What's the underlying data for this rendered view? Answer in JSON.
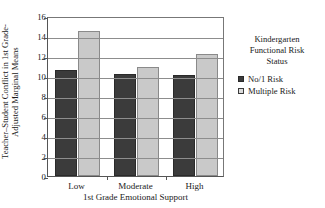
{
  "chart_data": {
    "type": "bar",
    "title": "",
    "xlabel": "1st Grade Emotional Support",
    "ylabel_line1": "Teacher–Student Conflict in 1st Grade-",
    "ylabel_line2": "Adjusted Marginal Means",
    "categories": [
      "Low",
      "Moderate",
      "High"
    ],
    "series": [
      {
        "name": "No/1 Risk",
        "values": [
          10.6,
          10.2,
          10.1
        ],
        "color": "#3b3b3b"
      },
      {
        "name": "Multiple Risk",
        "values": [
          14.5,
          10.9,
          12.2
        ],
        "color": "#c9c9c9"
      }
    ],
    "ylim": [
      0,
      16
    ],
    "yticks": [
      0,
      2,
      4,
      6,
      8,
      10,
      12,
      14,
      16
    ],
    "ytick_labels": [
      "0",
      "2",
      "4",
      "6",
      "8",
      "10",
      "12",
      "14",
      "16"
    ],
    "grid": true,
    "legend_position": "right",
    "legend_title_lines": [
      "Kindergarten",
      "Functional Risk",
      "Status"
    ]
  }
}
